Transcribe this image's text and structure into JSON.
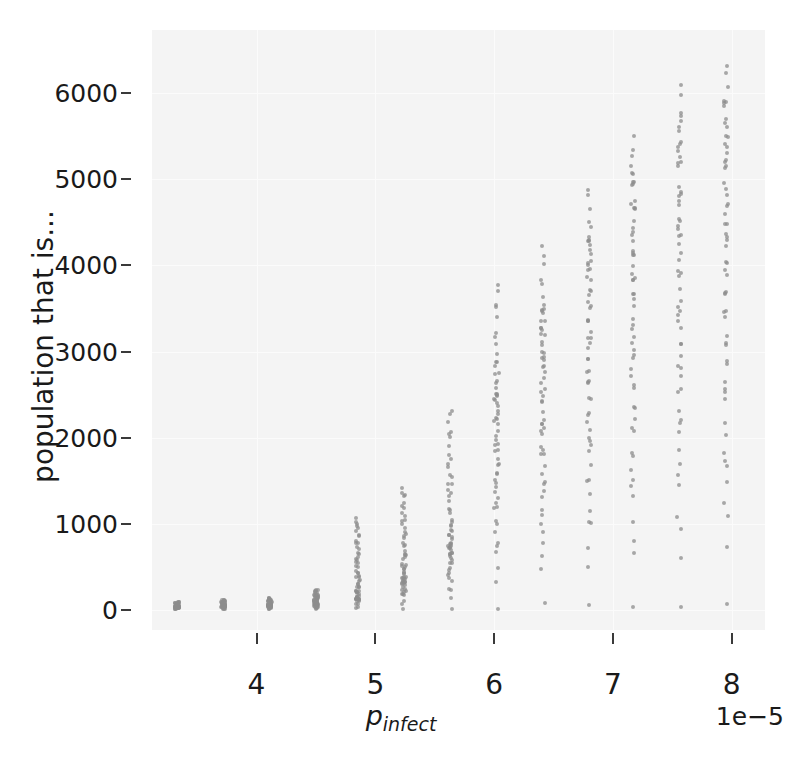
{
  "chart_data": {
    "type": "scatter",
    "title": "",
    "xlabel": "p_infect",
    "xlabel_base": "p",
    "xlabel_sub": "infect",
    "ylabel": "population that is...",
    "x_offset_text": "1e−5",
    "x_offset_factor": 1e-05,
    "xticks": [
      4,
      5,
      6,
      7,
      8
    ],
    "xticklabels": [
      "4",
      "5",
      "6",
      "7",
      "8"
    ],
    "yticks": [
      0,
      1000,
      2000,
      3000,
      4000,
      5000,
      6000
    ],
    "yticklabels": [
      "0",
      "1000",
      "2000",
      "3000",
      "4000",
      "5000",
      "6000"
    ],
    "xlim": [
      3.12,
      8.28
    ],
    "ylim": [
      -230,
      6730
    ],
    "grid": true,
    "legend": null,
    "marker": "circle",
    "marker_color": "#8c8c8c",
    "marker_opacity": 0.75,
    "plot_bgcolor": "#f4f4f4",
    "figure_bgcolor": "#ffffff",
    "gridline_color": "#fbfbfb",
    "note": "Each x category is a near-vertical strip of many repeated simulation outcomes; values below give the min/max/typical spread of each strip.",
    "categories_x": [
      3.33,
      3.72,
      4.11,
      4.5,
      4.85,
      5.24,
      5.63,
      6.02,
      6.41,
      6.8,
      7.17,
      7.56,
      7.95
    ],
    "series": [
      {
        "name": "population that is...",
        "strips": [
          {
            "x": 3.33,
            "min": 10,
            "max": 95,
            "median": 40,
            "n": 60
          },
          {
            "x": 3.72,
            "min": 10,
            "max": 120,
            "median": 45,
            "n": 60
          },
          {
            "x": 4.11,
            "min": 10,
            "max": 140,
            "median": 55,
            "n": 60
          },
          {
            "x": 4.5,
            "min": 10,
            "max": 235,
            "median": 70,
            "n": 60
          },
          {
            "x": 4.85,
            "min": 10,
            "max": 1080,
            "median": 120,
            "n": 60
          },
          {
            "x": 5.24,
            "min": 10,
            "max": 1430,
            "median": 330,
            "n": 60
          },
          {
            "x": 5.63,
            "min": 10,
            "max": 2320,
            "median": 700,
            "n": 60
          },
          {
            "x": 6.02,
            "min": 10,
            "max": 3790,
            "median": 2480,
            "n": 60
          },
          {
            "x": 6.41,
            "min": 40,
            "max": 4220,
            "median": 3350,
            "n": 60
          },
          {
            "x": 6.8,
            "min": 55,
            "max": 4960,
            "median": 4240,
            "n": 60
          },
          {
            "x": 7.17,
            "min": 40,
            "max": 5530,
            "median": 5080,
            "n": 60
          },
          {
            "x": 7.56,
            "min": 40,
            "max": 6090,
            "median": 5600,
            "n": 60
          },
          {
            "x": 7.95,
            "min": 40,
            "max": 6390,
            "median": 5870,
            "n": 60
          }
        ]
      }
    ]
  }
}
